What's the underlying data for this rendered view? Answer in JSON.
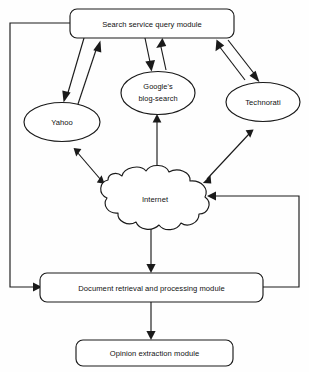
{
  "diagram": {
    "background_color": "#fefefe",
    "line_color": "#1a1a1a",
    "text_color": "#111111",
    "nodes": [
      {
        "id": "search-service-query-module",
        "label": "Search service query module",
        "shape": "rounded-rectangle"
      },
      {
        "id": "yahoo",
        "label": "Yahoo",
        "shape": "ellipse"
      },
      {
        "id": "google-blog-search",
        "label_line1": "Google's",
        "label_line2": "blog-search",
        "shape": "ellipse"
      },
      {
        "id": "technorati",
        "label": "Technorati",
        "shape": "ellipse"
      },
      {
        "id": "internet",
        "label": "Internet",
        "shape": "cloud"
      },
      {
        "id": "document-retrieval-and-processing-module",
        "label": "Document retrieval and processing module",
        "shape": "rounded-rectangle"
      },
      {
        "id": "opinion-extraction-module",
        "label": "Opinion extraction module",
        "shape": "rounded-rectangle"
      }
    ],
    "edges": [
      {
        "id": "query-to-yahoo",
        "from": "search-service-query-module",
        "to": "yahoo",
        "style": "arrow"
      },
      {
        "id": "yahoo-to-query",
        "from": "yahoo",
        "to": "search-service-query-module",
        "style": "arrow"
      },
      {
        "id": "query-to-google",
        "from": "search-service-query-module",
        "to": "google-blog-search",
        "style": "arrow"
      },
      {
        "id": "google-to-query",
        "from": "google-blog-search",
        "to": "search-service-query-module",
        "style": "arrow"
      },
      {
        "id": "query-to-technorati",
        "from": "search-service-query-module",
        "to": "technorati",
        "style": "arrow"
      },
      {
        "id": "technorati-to-query",
        "from": "technorati",
        "to": "search-service-query-module",
        "style": "arrow"
      },
      {
        "id": "yahoo-internet",
        "from": "yahoo",
        "to": "internet",
        "style": "double-arrow"
      },
      {
        "id": "google-internet",
        "from": "google-blog-search",
        "to": "internet",
        "style": "double-arrow"
      },
      {
        "id": "technorati-internet",
        "from": "technorati",
        "to": "internet",
        "style": "double-arrow"
      },
      {
        "id": "internet-to-document",
        "from": "internet",
        "to": "document-retrieval-and-processing-module",
        "style": "arrow"
      },
      {
        "id": "document-to-opinion",
        "from": "document-retrieval-and-processing-module",
        "to": "opinion-extraction-module",
        "style": "arrow"
      },
      {
        "id": "query-to-document-left-feedback",
        "from": "search-service-query-module",
        "to": "document-retrieval-and-processing-module",
        "style": "arrow"
      },
      {
        "id": "document-to-internet-right-feedback",
        "from": "document-retrieval-and-processing-module",
        "to": "internet",
        "style": "arrow"
      }
    ]
  }
}
